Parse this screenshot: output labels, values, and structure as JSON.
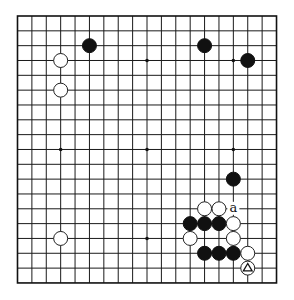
{
  "diagram": {
    "type": "go-board",
    "board_size": 19,
    "geometry": {
      "x0": 17.5,
      "y0": 16,
      "dx": 14.39,
      "dy": 14.83,
      "stone_radius": 7
    },
    "colors": {
      "line": "#1a1a1a",
      "black_stone": "#111111",
      "white_stone": "#ffffff",
      "background": "#ffffff"
    },
    "star_points": [
      [
        3,
        3
      ],
      [
        9,
        3
      ],
      [
        15,
        3
      ],
      [
        3,
        9
      ],
      [
        9,
        9
      ],
      [
        15,
        9
      ],
      [
        3,
        15
      ],
      [
        9,
        15
      ],
      [
        15,
        15
      ]
    ],
    "stones": [
      {
        "color": "black",
        "col": 5,
        "row": 2
      },
      {
        "color": "black",
        "col": 13,
        "row": 2
      },
      {
        "color": "black",
        "col": 16,
        "row": 3
      },
      {
        "color": "white",
        "col": 3,
        "row": 3
      },
      {
        "color": "white",
        "col": 3,
        "row": 5
      },
      {
        "color": "black",
        "col": 15,
        "row": 11
      },
      {
        "color": "white",
        "col": 13,
        "row": 13
      },
      {
        "color": "white",
        "col": 14,
        "row": 13
      },
      {
        "color": "black",
        "col": 12,
        "row": 14
      },
      {
        "color": "black",
        "col": 13,
        "row": 14
      },
      {
        "color": "black",
        "col": 14,
        "row": 14
      },
      {
        "color": "white",
        "col": 15,
        "row": 14
      },
      {
        "color": "white",
        "col": 3,
        "row": 15
      },
      {
        "color": "white",
        "col": 12,
        "row": 15
      },
      {
        "color": "white",
        "col": 15,
        "row": 15
      },
      {
        "color": "black",
        "col": 13,
        "row": 16
      },
      {
        "color": "black",
        "col": 14,
        "row": 16
      },
      {
        "color": "black",
        "col": 15,
        "row": 16
      },
      {
        "color": "white",
        "col": 16,
        "row": 16
      },
      {
        "color": "white",
        "col": 16,
        "row": 17,
        "mark": "triangle"
      }
    ],
    "labels": [
      {
        "text": "a",
        "col": 15,
        "row": 13
      }
    ]
  }
}
